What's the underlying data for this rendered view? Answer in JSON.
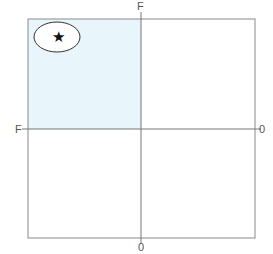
{
  "diagram": {
    "type": "quadrant-grid",
    "labels": {
      "top": "F",
      "left": "F",
      "right": "0",
      "bottom": "0"
    },
    "highlighted_quadrant": "top-left",
    "highlight_color": "#e8f6fb",
    "line_color": "#888888",
    "marker": {
      "symbol": "★",
      "enclosed_in": "ellipse",
      "quadrant": "top-left"
    }
  }
}
